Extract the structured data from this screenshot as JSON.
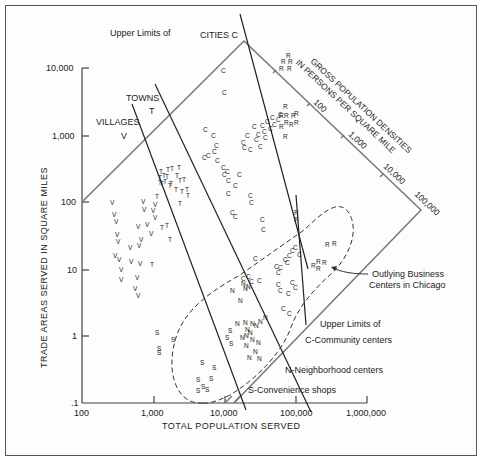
{
  "chart_data": {
    "type": "scatter",
    "title": "",
    "xlabel": "TOTAL POPULATION SERVED",
    "ylabel": "TRADE AREAS SERVED IN SQUARE MILES",
    "x_scale": "log",
    "y_scale": "log",
    "xlim": [
      100,
      1000000
    ],
    "ylim": [
      0.1,
      10000
    ],
    "x_ticks": [
      "100",
      "1,000",
      "10,000",
      "100,000",
      "1,000,000"
    ],
    "y_ticks": [
      "10,000",
      "1,000",
      "100",
      "10",
      "1",
      ".1"
    ],
    "grid": false,
    "density_axis": {
      "label_line1": "GROSS POPULATION DENSITIES",
      "label_line2": "IN PERSONS PER SQUARE MILE",
      "ticks": [
        "100",
        "1,000",
        "10,000",
        "100,000"
      ]
    },
    "annotations": {
      "upper_limits_top": "Upper Limits of",
      "cities": "CITIES C",
      "towns": "TOWNS",
      "towns_letter": "T",
      "villages": "VILLAGES",
      "villages_letter": "V",
      "upper_limits_bottom": "Upper Limits of",
      "community": "C-Community centers",
      "neighborhood": "N-Neighborhood centers",
      "convenience": "S-Convenience shops",
      "outlying_line1": "Outlying Business",
      "outlying_line2": "Centers in Chicago"
    },
    "series": [
      {
        "name": "V - Villages",
        "marker": "V",
        "points": [
          [
            110,
            205
          ],
          [
            112,
            217
          ],
          [
            114,
            224
          ],
          [
            115,
            237
          ],
          [
            116,
            244
          ],
          [
            113,
            258
          ],
          [
            117,
            262
          ],
          [
            119,
            272
          ],
          [
            119,
            282
          ],
          [
            128,
            250
          ],
          [
            129,
            264
          ],
          [
            137,
            248
          ],
          [
            138,
            266
          ],
          [
            135,
            280
          ],
          [
            133,
            291
          ],
          [
            136,
            298
          ],
          [
            136,
            229
          ],
          [
            139,
            242
          ],
          [
            141,
            204
          ],
          [
            142,
            212
          ],
          [
            145,
            227
          ],
          [
            149,
            236
          ],
          [
            151,
            213
          ],
          [
            153,
            220
          ],
          [
            153,
            207
          ]
        ]
      },
      {
        "name": "T - Towns",
        "marker": "T",
        "points": [
          [
            155,
            199
          ],
          [
            158,
            180
          ],
          [
            162,
            178
          ],
          [
            159,
            174
          ],
          [
            166,
            172
          ],
          [
            170,
            171
          ],
          [
            169,
            186
          ],
          [
            177,
            170
          ],
          [
            178,
            183
          ],
          [
            158,
            185
          ],
          [
            160,
            186
          ],
          [
            163,
            184
          ],
          [
            165,
            179
          ],
          [
            168,
            188
          ],
          [
            174,
            192
          ],
          [
            180,
            194
          ],
          [
            182,
            182
          ],
          [
            160,
            230
          ],
          [
            165,
            228
          ],
          [
            150,
            267
          ],
          [
            168,
            242
          ],
          [
            178,
            206
          ],
          [
            175,
            178
          ],
          [
            185,
            192
          ],
          [
            186,
            198
          ]
        ]
      },
      {
        "name": "C - Cities",
        "marker": "C",
        "points": [
          [
            221,
            73
          ],
          [
            222,
            95
          ],
          [
            203,
            132
          ],
          [
            202,
            160
          ],
          [
            206,
            158
          ],
          [
            211,
            138
          ],
          [
            212,
            154
          ],
          [
            214,
            148
          ],
          [
            215,
            163
          ],
          [
            221,
            170
          ],
          [
            222,
            177
          ],
          [
            225,
            174
          ],
          [
            226,
            183
          ],
          [
            226,
            196
          ],
          [
            233,
            188
          ],
          [
            237,
            177
          ],
          [
            241,
            145
          ],
          [
            242,
            150
          ],
          [
            245,
            138
          ],
          [
            248,
            152
          ],
          [
            252,
            129
          ],
          [
            254,
            142
          ],
          [
            256,
            137
          ],
          [
            258,
            149
          ],
          [
            260,
            128
          ],
          [
            262,
            134
          ],
          [
            263,
            140
          ],
          [
            265,
            124
          ],
          [
            268,
            131
          ],
          [
            270,
            120
          ],
          [
            272,
            127
          ],
          [
            276,
            122
          ],
          [
            278,
            117
          ],
          [
            248,
            198
          ],
          [
            249,
            205
          ],
          [
            230,
            215
          ],
          [
            233,
            219
          ]
        ]
      },
      {
        "name": "C - Community centers",
        "marker": "C",
        "points": [
          [
            260,
            222
          ],
          [
            261,
            232
          ],
          [
            253,
            261
          ],
          [
            241,
            281
          ],
          [
            246,
            279
          ],
          [
            249,
            284
          ],
          [
            257,
            283
          ],
          [
            274,
            269
          ],
          [
            276,
            275
          ],
          [
            278,
            270
          ],
          [
            283,
            262
          ],
          [
            285,
            265
          ],
          [
            287,
            258
          ],
          [
            290,
            253
          ],
          [
            293,
            250
          ],
          [
            297,
            257
          ],
          [
            276,
            287
          ],
          [
            278,
            293
          ],
          [
            290,
            285
          ],
          [
            293,
            290
          ],
          [
            281,
            311
          ],
          [
            286,
            296
          ],
          [
            287,
            316
          ]
        ]
      },
      {
        "name": "N - Neighborhood centers",
        "marker": "N",
        "points": [
          [
            230,
            293
          ],
          [
            241,
            286
          ],
          [
            243,
            291
          ],
          [
            246,
            289
          ],
          [
            238,
            303
          ],
          [
            235,
            326
          ],
          [
            243,
            325
          ],
          [
            250,
            326
          ],
          [
            254,
            328
          ],
          [
            258,
            324
          ],
          [
            245,
            332
          ],
          [
            240,
            340
          ],
          [
            244,
            338
          ],
          [
            248,
            335
          ],
          [
            250,
            342
          ],
          [
            244,
            348
          ],
          [
            253,
            354
          ],
          [
            256,
            345
          ],
          [
            263,
            320
          ],
          [
            247,
            360
          ],
          [
            257,
            361
          ]
        ]
      },
      {
        "name": "S - Convenience shops",
        "marker": "S",
        "points": [
          [
            155,
            335
          ],
          [
            171,
            342
          ],
          [
            157,
            351
          ],
          [
            157,
            355
          ],
          [
            196,
            382
          ],
          [
            200,
            365
          ],
          [
            212,
            370
          ],
          [
            209,
            381
          ],
          [
            196,
            393
          ],
          [
            201,
            389
          ],
          [
            205,
            392
          ],
          [
            228,
            333
          ],
          [
            225,
            340
          ],
          [
            229,
            346
          ]
        ]
      },
      {
        "name": "R - Outlying Business Centers in Chicago",
        "marker": "R",
        "points": [
          [
            286,
            58
          ],
          [
            281,
            64
          ],
          [
            288,
            64
          ],
          [
            279,
            71
          ],
          [
            287,
            71
          ],
          [
            283,
            109
          ],
          [
            279,
            118
          ],
          [
            284,
            118
          ],
          [
            291,
            118
          ],
          [
            294,
            116
          ],
          [
            279,
            129
          ],
          [
            284,
            125
          ],
          [
            289,
            127
          ],
          [
            294,
            125
          ],
          [
            283,
            139
          ],
          [
            294,
            215
          ],
          [
            294,
            222
          ],
          [
            325,
            247
          ],
          [
            332,
            246
          ],
          [
            311,
            268
          ],
          [
            316,
            264
          ],
          [
            322,
            265
          ],
          [
            316,
            271
          ]
        ]
      }
    ],
    "limit_lines": [
      {
        "name": "Upper limits of Villages",
        "from": [
          132,
          104
        ],
        "to": [
          246,
          410
        ]
      },
      {
        "name": "Upper limits of Towns",
        "from": [
          155,
          84
        ],
        "to": [
          311,
          410
        ]
      },
      {
        "name": "Upper limits of Cities",
        "from": [
          240,
          14
        ],
        "to": [
          308,
          269
        ]
      },
      {
        "name": "Upper limits of Community centers",
        "from": [
          291,
          180
        ],
        "to": [
          306,
          325
        ]
      }
    ]
  }
}
